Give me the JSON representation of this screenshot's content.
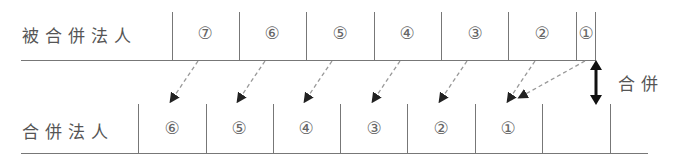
{
  "top_row": {
    "label": "被合併法人",
    "cells": [
      {
        "id": 7,
        "text": "⑦",
        "x": 205
      },
      {
        "id": 6,
        "text": "⑥",
        "x": 272
      },
      {
        "id": 5,
        "text": "⑤",
        "x": 340
      },
      {
        "id": 4,
        "text": "④",
        "x": 407
      },
      {
        "id": 3,
        "text": "③",
        "x": 475
      },
      {
        "id": 2,
        "text": "②",
        "x": 542
      },
      {
        "id": 1,
        "text": "①",
        "x": 586
      }
    ]
  },
  "bottom_row": {
    "label": "合併法人",
    "cells": [
      {
        "id": 6,
        "text": "⑥",
        "x": 172
      },
      {
        "id": 5,
        "text": "⑤",
        "x": 239
      },
      {
        "id": 4,
        "text": "④",
        "x": 306
      },
      {
        "id": 3,
        "text": "③",
        "x": 374
      },
      {
        "id": 2,
        "text": "②",
        "x": 441
      },
      {
        "id": 1,
        "text": "①",
        "x": 508
      },
      {
        "id": 0,
        "text": "",
        "x": 576
      }
    ]
  },
  "merger_label": "合併",
  "colors": {
    "line": "#777777",
    "text": "#555555",
    "arrow": "#222222",
    "dashed": "#999999"
  }
}
